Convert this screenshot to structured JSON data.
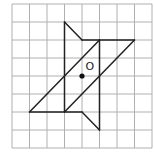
{
  "diagram": {
    "grid": {
      "cols": 8,
      "rows": 8,
      "origin_x": 12,
      "origin_y": 4,
      "cell_w": 17.5,
      "cell_h": 18,
      "line_color": "#b0b0b0"
    },
    "shape_color": "#222222",
    "segments": [
      [
        3,
        1,
        4,
        2
      ],
      [
        4,
        2,
        7,
        2
      ],
      [
        7,
        2,
        3,
        6
      ],
      [
        3,
        1,
        3,
        6
      ],
      [
        1,
        6,
        5,
        2
      ],
      [
        1,
        6,
        4,
        6
      ],
      [
        4,
        6,
        5,
        7
      ],
      [
        5,
        2,
        5,
        7
      ]
    ],
    "center_point": {
      "x": 4,
      "y": 4
    },
    "center_label": "O"
  }
}
